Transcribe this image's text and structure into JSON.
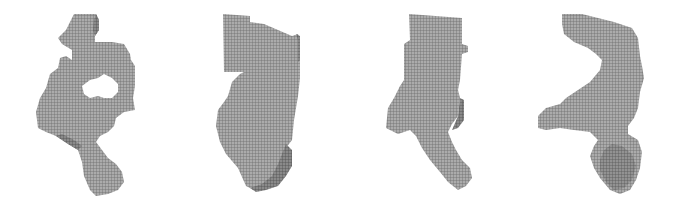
{
  "figure": {
    "panels": [
      {
        "id": "shape-1",
        "label": "voxel shape with central hole"
      },
      {
        "id": "shape-2",
        "label": "voxel shape, tall block with tapering base"
      },
      {
        "id": "shape-3",
        "label": "voxel shape, tall block with diagonal leg"
      },
      {
        "id": "shape-4",
        "label": "voxel shape, curved arm with lower cluster"
      }
    ],
    "colors": {
      "background": "#ffffff",
      "voxel_face": "#a9a9a9",
      "voxel_edge": "#6b6b6b",
      "voxel_shadow": "#5a5a5a"
    }
  }
}
